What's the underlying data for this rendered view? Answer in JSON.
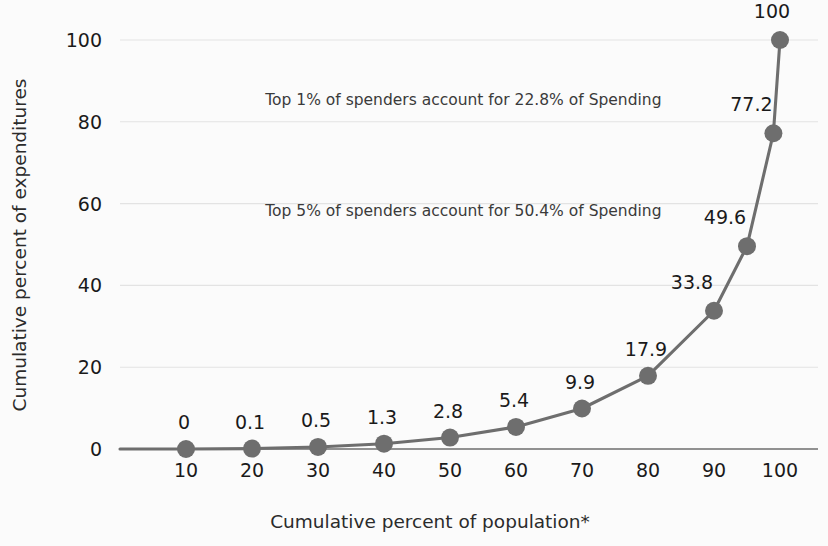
{
  "chart_data": {
    "type": "line",
    "title": "",
    "xlabel": "Cumulative percent of population*",
    "ylabel": "Cumulative percent of expenditures",
    "xlim": [
      0,
      104
    ],
    "ylim": [
      0,
      105
    ],
    "xticks": [
      10,
      20,
      30,
      40,
      50,
      60,
      70,
      80,
      90,
      100
    ],
    "xtick_labels": [
      "10",
      "20",
      "30",
      "40",
      "50",
      "60",
      "70",
      "80",
      "90",
      "100"
    ],
    "yticks": [
      0,
      20,
      40,
      60,
      80,
      100
    ],
    "ytick_labels": [
      "0",
      "20",
      "40",
      "60",
      "80",
      "100"
    ],
    "grid": "horizontal",
    "legend": "none",
    "marker": "circle",
    "series": [
      {
        "name": "Cumulative spending concentration",
        "color": "#6e6e6e",
        "x": [
          10,
          20,
          30,
          40,
          50,
          60,
          70,
          80,
          90,
          95,
          99,
          100
        ],
        "values": [
          0,
          0.1,
          0.5,
          1.3,
          2.8,
          5.4,
          9.9,
          17.9,
          33.8,
          49.6,
          77.2,
          100
        ],
        "point_labels": [
          "0",
          "0.1",
          "0.5",
          "1.3",
          "2.8",
          "5.4",
          "9.9",
          "17.9",
          "33.8",
          "49.6",
          "77.2",
          "100"
        ]
      }
    ],
    "annotations": [
      {
        "text": "Top 1% of spenders account for 22.8% of Spending",
        "x": 22,
        "y": 84
      },
      {
        "text": "Top 5% of spenders account for 50.4% of Spending",
        "x": 22,
        "y": 57
      }
    ]
  },
  "colors": {
    "series": "#6e6e6e",
    "grid": "#e3e3e3",
    "axis": "#6e6e6e",
    "text": "#1a1a1a",
    "background": "#fbfbfb"
  }
}
